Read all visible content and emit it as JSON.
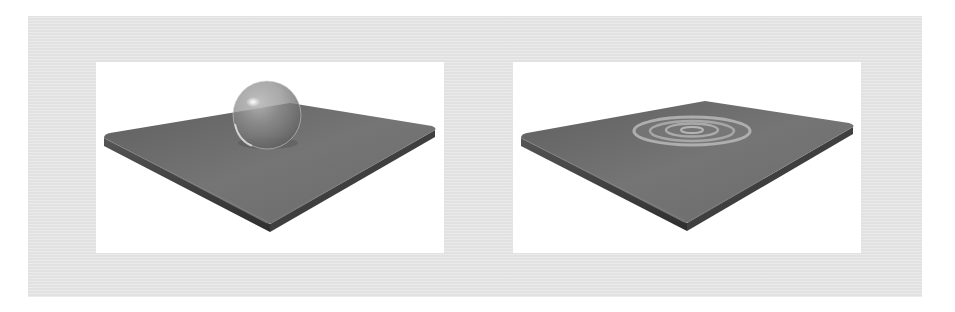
{
  "figure": {
    "background_color": "#e6e6e6",
    "panel_color": "#ffffff",
    "panels": [
      {
        "id": "left",
        "label": "Glass sphere resting on slab",
        "objects": [
          "slab",
          "glass-sphere"
        ],
        "colors": {
          "slab_top": "#6e6e6e",
          "slab_edge": "#3c3c3c",
          "sphere": "#8a8a8a",
          "highlight": "#f0f0f0"
        }
      },
      {
        "id": "right",
        "label": "Concentric ripples on slab surface",
        "objects": [
          "slab",
          "ripples"
        ],
        "ripple_count": 4,
        "colors": {
          "slab_top": "#6e6e6e",
          "slab_edge": "#3c3c3c",
          "ripple": "#b4b4b4"
        }
      }
    ]
  }
}
